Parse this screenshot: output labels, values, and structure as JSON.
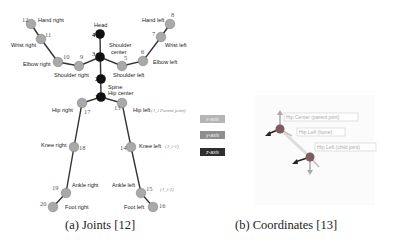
{
  "figure_a": {
    "caption": "(a) Joints [12]",
    "joints": [
      {
        "id": "1",
        "name": "Spine",
        "name2": "Hip center",
        "x": 101,
        "y": 97,
        "type": "core"
      },
      {
        "id": "2",
        "name": "",
        "x": 101,
        "y": 79,
        "type": "core"
      },
      {
        "id": "3",
        "name": "Shoulder",
        "name2": "center",
        "x": 100,
        "y": 57,
        "type": "core"
      },
      {
        "id": "4",
        "name": "Head",
        "x": 100,
        "y": 34,
        "type": "core"
      },
      {
        "id": "5",
        "name": "Shoulder left",
        "x": 122,
        "y": 66,
        "type": "limb"
      },
      {
        "id": "6",
        "name": "Elbow left",
        "x": 143,
        "y": 61,
        "type": "limb"
      },
      {
        "id": "7",
        "name": "Wrist left",
        "x": 161,
        "y": 37,
        "type": "limb"
      },
      {
        "id": "8",
        "name": "Hand left",
        "x": 170,
        "y": 24,
        "type": "limb"
      },
      {
        "id": "9",
        "name": "Shoulder right",
        "x": 79,
        "y": 66,
        "type": "limb"
      },
      {
        "id": "10",
        "name": "Elbow right",
        "x": 58,
        "y": 62,
        "type": "limb"
      },
      {
        "id": "11",
        "name": "Wrist right",
        "x": 41,
        "y": 39,
        "type": "limb"
      },
      {
        "id": "12",
        "name": "Hand right",
        "x": 31,
        "y": 24,
        "type": "limb"
      },
      {
        "id": "13",
        "name": "Hip left",
        "x": 122,
        "y": 103,
        "type": "limb"
      },
      {
        "id": "14",
        "name": "Knee left",
        "x": 131,
        "y": 147,
        "type": "limb"
      },
      {
        "id": "15",
        "name": "Ankle left",
        "x": 141,
        "y": 193,
        "type": "limb"
      },
      {
        "id": "16",
        "name": "Foot left",
        "x": 153,
        "y": 207,
        "type": "limb"
      },
      {
        "id": "17",
        "name": "Hip right",
        "x": 82,
        "y": 103,
        "type": "limb"
      },
      {
        "id": "18",
        "name": "Knee right",
        "x": 74,
        "y": 147,
        "type": "limb"
      },
      {
        "id": "19",
        "name": "Ankle right",
        "x": 66,
        "y": 193,
        "type": "limb"
      },
      {
        "id": "20",
        "name": "Foot right",
        "x": 53,
        "y": 207,
        "type": "limb"
      }
    ],
    "annotations": {
      "hip_left": "(J_i  Parent joint)",
      "knee_left": "(J_i-1)",
      "ankle_left": "(J_i-2)"
    }
  },
  "figure_b": {
    "caption": "(b) Coordinates [13]",
    "legend": [
      {
        "label": "x-axis",
        "color": "#b5b5b5"
      },
      {
        "label": "y-axis",
        "color": "#8e8e8e"
      },
      {
        "label": "z-axis",
        "color": "#2e2e2e"
      }
    ],
    "tags": [
      "Hip Center (parent joint)",
      "Hip Left (bone)",
      "Hip Left (child joint)"
    ]
  }
}
